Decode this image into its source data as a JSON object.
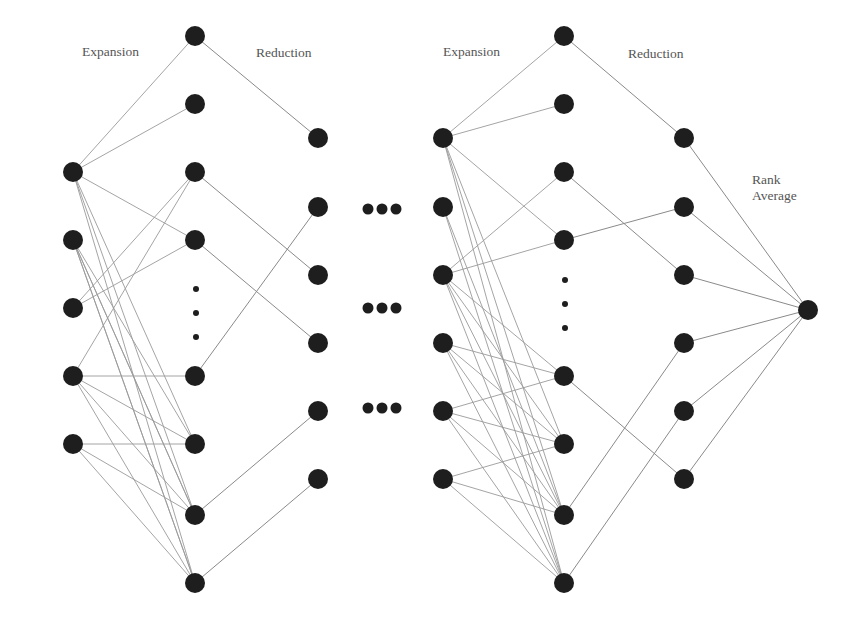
{
  "diagram": {
    "title": "",
    "labels": [
      {
        "id": "expansion-1",
        "text": "Expansion",
        "x": 82,
        "y": 52
      },
      {
        "id": "reduction-1",
        "text": "Reduction",
        "x": 256,
        "y": 53
      },
      {
        "id": "expansion-2",
        "text": "Expansion",
        "x": 443,
        "y": 52
      },
      {
        "id": "reduction-2",
        "text": "Reduction",
        "x": 628,
        "y": 54
      },
      {
        "id": "rank-average",
        "text": "Rank\nAverage",
        "x": 752,
        "y": 172
      }
    ],
    "colors": {
      "node": "#1e1e1e",
      "edge": "#9a9a9a",
      "label": "#555555",
      "background": "#ffffff"
    },
    "node_radius": 10,
    "columns": {
      "A": {
        "x": 73,
        "ys": [
          172,
          240,
          308,
          376,
          444
        ]
      },
      "B": {
        "x": 195,
        "ys": [
          36,
          104,
          172,
          240,
          376,
          444,
          515,
          583
        ]
      },
      "C": {
        "x": 318,
        "ys": [
          138,
          207,
          275,
          343,
          411,
          479
        ]
      },
      "D": {
        "x": 443,
        "ys": [
          138,
          207,
          275,
          343,
          411,
          479
        ]
      },
      "E": {
        "x": 564,
        "ys": [
          36,
          104,
          172,
          240,
          376,
          444,
          515,
          583
        ]
      },
      "F": {
        "x": 684,
        "ys": [
          138,
          207,
          275,
          343,
          411,
          479
        ]
      },
      "G": {
        "x": 808,
        "ys": [
          310
        ]
      }
    },
    "vertical_ellipses": [
      {
        "x": 196,
        "ys": [
          289,
          313,
          337
        ]
      },
      {
        "x": 565,
        "ys": [
          280,
          304,
          328
        ]
      }
    ],
    "horizontal_ellipses": [
      {
        "xs": [
          368,
          382,
          396
        ],
        "y": 209
      },
      {
        "xs": [
          368,
          382,
          396
        ],
        "y": 308
      },
      {
        "xs": [
          368,
          382,
          396
        ],
        "y": 408
      }
    ],
    "expansion_edges_1": [
      [
        "A",
        0,
        "B",
        0
      ],
      [
        "A",
        0,
        "B",
        1
      ],
      [
        "A",
        0,
        "B",
        3
      ],
      [
        "A",
        0,
        "B",
        5
      ],
      [
        "A",
        0,
        "B",
        6
      ],
      [
        "A",
        0,
        "B",
        7
      ],
      [
        "A",
        1,
        "B",
        5
      ],
      [
        "A",
        1,
        "B",
        6
      ],
      [
        "A",
        1,
        "B",
        7
      ],
      [
        "A",
        1,
        "B",
        6
      ],
      [
        "A",
        1,
        "B",
        7
      ],
      [
        "A",
        2,
        "B",
        2
      ],
      [
        "A",
        2,
        "B",
        3
      ],
      [
        "A",
        3,
        "B",
        4
      ],
      [
        "A",
        3,
        "B",
        5
      ],
      [
        "A",
        3,
        "B",
        6
      ],
      [
        "A",
        3,
        "B",
        7
      ],
      [
        "A",
        3,
        "B",
        2
      ],
      [
        "A",
        4,
        "B",
        5
      ],
      [
        "A",
        4,
        "B",
        6
      ],
      [
        "A",
        4,
        "B",
        7
      ]
    ],
    "reduction_edges_1": [
      [
        "B",
        0,
        "C",
        0
      ],
      [
        "B",
        2,
        "C",
        2
      ],
      [
        "B",
        3,
        "C",
        3
      ],
      [
        "B",
        4,
        "C",
        1
      ],
      [
        "B",
        6,
        "C",
        4
      ],
      [
        "B",
        7,
        "C",
        5
      ]
    ],
    "expansion_edges_2": [
      [
        "D",
        0,
        "E",
        0
      ],
      [
        "D",
        0,
        "E",
        1
      ],
      [
        "D",
        0,
        "E",
        3
      ],
      [
        "D",
        0,
        "E",
        6
      ],
      [
        "D",
        0,
        "E",
        7
      ],
      [
        "D",
        0,
        "E",
        5
      ],
      [
        "D",
        1,
        "E",
        6
      ],
      [
        "D",
        1,
        "E",
        7
      ],
      [
        "D",
        2,
        "E",
        2
      ],
      [
        "D",
        2,
        "E",
        3
      ],
      [
        "D",
        2,
        "E",
        5
      ],
      [
        "D",
        2,
        "E",
        6
      ],
      [
        "D",
        2,
        "E",
        7
      ],
      [
        "D",
        2,
        "E",
        4
      ],
      [
        "D",
        3,
        "E",
        4
      ],
      [
        "D",
        3,
        "E",
        5
      ],
      [
        "D",
        3,
        "E",
        6
      ],
      [
        "D",
        3,
        "E",
        7
      ],
      [
        "D",
        4,
        "E",
        4
      ],
      [
        "D",
        4,
        "E",
        6
      ],
      [
        "D",
        4,
        "E",
        7
      ],
      [
        "D",
        4,
        "E",
        5
      ],
      [
        "D",
        5,
        "E",
        5
      ],
      [
        "D",
        5,
        "E",
        6
      ],
      [
        "D",
        5,
        "E",
        7
      ]
    ],
    "reduction_edges_2": [
      [
        "E",
        0,
        "F",
        0
      ],
      [
        "E",
        2,
        "F",
        2
      ],
      [
        "E",
        3,
        "F",
        1
      ],
      [
        "E",
        4,
        "F",
        5
      ],
      [
        "E",
        6,
        "F",
        3
      ],
      [
        "E",
        7,
        "F",
        4
      ]
    ],
    "output_edges": [
      [
        "F",
        0,
        "G",
        0
      ],
      [
        "F",
        1,
        "G",
        0
      ],
      [
        "F",
        2,
        "G",
        0
      ],
      [
        "F",
        3,
        "G",
        0
      ],
      [
        "F",
        4,
        "G",
        0
      ],
      [
        "F",
        5,
        "G",
        0
      ]
    ]
  }
}
